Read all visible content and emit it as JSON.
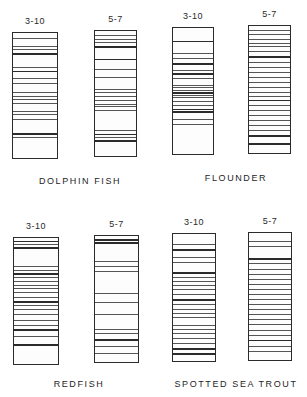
{
  "figure": {
    "panels": [
      {
        "species": "DOLPHIN FISH",
        "label_pos": {
          "x": 80,
          "y": 184
        },
        "gels": [
          {
            "ph_range": "3-10",
            "box": {
              "x": 12,
              "y": 32,
              "w": 46,
              "h": 127
            },
            "bands": [
              [
                0.04,
                1
              ],
              [
                0.1,
                1
              ],
              [
                0.13,
                1
              ],
              [
                0.16,
                2
              ],
              [
                0.27,
                1
              ],
              [
                0.3,
                2
              ],
              [
                0.36,
                1
              ],
              [
                0.4,
                1
              ],
              [
                0.47,
                1
              ],
              [
                0.5,
                1
              ],
              [
                0.53,
                1
              ],
              [
                0.56,
                1
              ],
              [
                0.62,
                1
              ],
              [
                0.65,
                1
              ],
              [
                0.69,
                1
              ],
              [
                0.8,
                2
              ],
              [
                0.83,
                1
              ]
            ]
          },
          {
            "ph_range": "5-7",
            "box": {
              "x": 94,
              "y": 30,
              "w": 43,
              "h": 127
            },
            "bands": [
              [
                0.03,
                1
              ],
              [
                0.06,
                1
              ],
              [
                0.09,
                1
              ],
              [
                0.12,
                2
              ],
              [
                0.22,
                2
              ],
              [
                0.3,
                1
              ],
              [
                0.37,
                1
              ],
              [
                0.46,
                1
              ],
              [
                0.49,
                1
              ],
              [
                0.52,
                1
              ],
              [
                0.55,
                1
              ],
              [
                0.58,
                1
              ],
              [
                0.6,
                1
              ],
              [
                0.63,
                1
              ],
              [
                0.79,
                1
              ],
              [
                0.82,
                2
              ],
              [
                0.85,
                1
              ],
              [
                0.87,
                2
              ]
            ]
          }
        ]
      },
      {
        "species": "FLOUNDER",
        "label_pos": {
          "x": 236,
          "y": 181
        },
        "gels": [
          {
            "ph_range": "3-10",
            "box": {
              "x": 172,
              "y": 27,
              "w": 42,
              "h": 128
            },
            "bands": [
              [
                0.1,
                2
              ],
              [
                0.2,
                1
              ],
              [
                0.24,
                1
              ],
              [
                0.28,
                2
              ],
              [
                0.33,
                1
              ],
              [
                0.36,
                2
              ],
              [
                0.4,
                1
              ],
              [
                0.45,
                1
              ],
              [
                0.47,
                1
              ],
              [
                0.49,
                1
              ],
              [
                0.51,
                2
              ],
              [
                0.53,
                1
              ],
              [
                0.55,
                1
              ],
              [
                0.58,
                1
              ],
              [
                0.61,
                1
              ],
              [
                0.64,
                2
              ],
              [
                0.66,
                2
              ],
              [
                0.72,
                1
              ],
              [
                0.76,
                1
              ]
            ]
          },
          {
            "ph_range": "5-7",
            "box": {
              "x": 248,
              "y": 25,
              "w": 43,
              "h": 129
            },
            "bands": [
              [
                0.03,
                1
              ],
              [
                0.06,
                1
              ],
              [
                0.1,
                1
              ],
              [
                0.13,
                1
              ],
              [
                0.16,
                1
              ],
              [
                0.2,
                1
              ],
              [
                0.24,
                2
              ],
              [
                0.28,
                1
              ],
              [
                0.32,
                1
              ],
              [
                0.36,
                1
              ],
              [
                0.4,
                1
              ],
              [
                0.44,
                1
              ],
              [
                0.48,
                1
              ],
              [
                0.52,
                1
              ],
              [
                0.55,
                1
              ],
              [
                0.58,
                2
              ],
              [
                0.62,
                1
              ],
              [
                0.66,
                1
              ],
              [
                0.7,
                1
              ],
              [
                0.74,
                1
              ],
              [
                0.78,
                1
              ],
              [
                0.82,
                1
              ],
              [
                0.86,
                2
              ],
              [
                0.92,
                2
              ]
            ]
          }
        ]
      },
      {
        "species": "REDFISH",
        "label_pos": {
          "x": 79,
          "y": 387
        },
        "gels": [
          {
            "ph_range": "3-10",
            "box": {
              "x": 13,
              "y": 237,
              "w": 46,
              "h": 128
            },
            "bands": [
              [
                0.02,
                2
              ],
              [
                0.05,
                1
              ],
              [
                0.07,
                2
              ],
              [
                0.22,
                1
              ],
              [
                0.25,
                1
              ],
              [
                0.28,
                2
              ],
              [
                0.31,
                1
              ],
              [
                0.34,
                1
              ],
              [
                0.37,
                1
              ],
              [
                0.4,
                1
              ],
              [
                0.43,
                1
              ],
              [
                0.47,
                1
              ],
              [
                0.5,
                2
              ],
              [
                0.53,
                1
              ],
              [
                0.56,
                1
              ],
              [
                0.6,
                1
              ],
              [
                0.65,
                1
              ],
              [
                0.69,
                1
              ],
              [
                0.72,
                2
              ],
              [
                0.78,
                1
              ],
              [
                0.84,
                2
              ]
            ]
          },
          {
            "ph_range": "5-7",
            "box": {
              "x": 94,
              "y": 235,
              "w": 45,
              "h": 128
            },
            "bands": [
              [
                0.02,
                3
              ],
              [
                0.05,
                2
              ],
              [
                0.2,
                1
              ],
              [
                0.24,
                1
              ],
              [
                0.28,
                1
              ],
              [
                0.45,
                1
              ],
              [
                0.52,
                1
              ],
              [
                0.62,
                1
              ],
              [
                0.74,
                1
              ],
              [
                0.77,
                1
              ],
              [
                0.82,
                2
              ],
              [
                0.87,
                1
              ],
              [
                0.93,
                1
              ]
            ]
          }
        ]
      },
      {
        "species": "SPOTTED SEA TROUT",
        "label_pos": {
          "x": 236,
          "y": 387
        },
        "gels": [
          {
            "ph_range": "3-10",
            "box": {
              "x": 172,
              "y": 233,
              "w": 44,
              "h": 129
            },
            "bands": [
              [
                0.08,
                1
              ],
              [
                0.12,
                2
              ],
              [
                0.18,
                1
              ],
              [
                0.22,
                1
              ],
              [
                0.3,
                2
              ],
              [
                0.34,
                1
              ],
              [
                0.37,
                1
              ],
              [
                0.4,
                1
              ],
              [
                0.43,
                1
              ],
              [
                0.47,
                1
              ],
              [
                0.51,
                2
              ],
              [
                0.55,
                1
              ],
              [
                0.59,
                1
              ],
              [
                0.62,
                1
              ],
              [
                0.65,
                1
              ],
              [
                0.72,
                1
              ],
              [
                0.75,
                1
              ],
              [
                0.78,
                1
              ],
              [
                0.82,
                1
              ],
              [
                0.86,
                1
              ],
              [
                0.9,
                2
              ],
              [
                0.94,
                2
              ]
            ]
          },
          {
            "ph_range": "5-7",
            "box": {
              "x": 248,
              "y": 232,
              "w": 44,
              "h": 129
            },
            "bands": [
              [
                0.06,
                1
              ],
              [
                0.1,
                1
              ],
              [
                0.2,
                2
              ],
              [
                0.24,
                1
              ],
              [
                0.28,
                1
              ],
              [
                0.32,
                1
              ],
              [
                0.36,
                1
              ],
              [
                0.4,
                1
              ],
              [
                0.44,
                1
              ],
              [
                0.48,
                1
              ],
              [
                0.52,
                1
              ],
              [
                0.56,
                1
              ],
              [
                0.6,
                1
              ],
              [
                0.64,
                1
              ],
              [
                0.68,
                1
              ],
              [
                0.72,
                1
              ],
              [
                0.76,
                1
              ],
              [
                0.8,
                1
              ],
              [
                0.84,
                2
              ],
              [
                0.89,
                1
              ],
              [
                0.93,
                1
              ]
            ]
          }
        ]
      }
    ],
    "lane_label_offset_y": -16
  }
}
